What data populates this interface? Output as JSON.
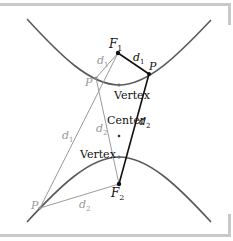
{
  "diagram": {
    "type": "hyperbola-foci-diagram",
    "colors": {
      "frame": "#c8c8c8",
      "curve": "#5a5a5a",
      "dark_line": "#111111",
      "light_line": "#9a9a9a",
      "dark_text": "#111111",
      "light_text": "#9a9a9a"
    },
    "labels": {
      "f1_main": "F",
      "f1_sub": "1",
      "f2_main": "F",
      "f2_sub": "2",
      "p_right": "P",
      "p_left_upper": "P",
      "p_left_lower": "P",
      "d1_dark_main": "d",
      "d1_dark_sub": "1",
      "d2_dark_main": "d",
      "d2_dark_sub": "2",
      "d1_light_upper_main": "d",
      "d1_light_upper_sub": "1",
      "d2_light_mid_main": "d",
      "d2_light_mid_sub": "2",
      "d1_light_lower_main": "d",
      "d1_light_lower_sub": "1",
      "d2_light_bottom_main": "d",
      "d2_light_bottom_sub": "2",
      "vertex_upper": "Vertex",
      "vertex_lower": "Vertex",
      "center": "Center"
    },
    "points": {
      "F1": [
        118,
        53
      ],
      "F2": [
        119,
        184
      ],
      "P_right": [
        149,
        74
      ],
      "P_left_upper": [
        96,
        78
      ],
      "P_left_lower": [
        40,
        208
      ],
      "vertex_upper": [
        119,
        85
      ],
      "vertex_lower": [
        119,
        157
      ],
      "center": [
        119,
        136
      ]
    }
  }
}
